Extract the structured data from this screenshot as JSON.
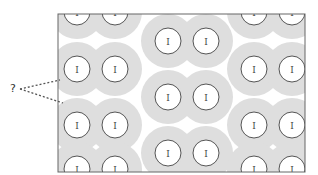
{
  "figure": {
    "question_label": "?",
    "circle_label": "I",
    "circle_label_note": "glyph may be '1' or 'I'; not legible at this resolution",
    "colors": {
      "background": "#ffffff",
      "halo": "#dedede",
      "circle_fill": "#ffffff",
      "circle_stroke": "#555555",
      "frame_stroke": "#666666",
      "pointer_stroke": "#555555"
    },
    "frame": {
      "x": 58,
      "y": 14,
      "width": 247,
      "height": 158
    },
    "halo_radius": 27,
    "circle_radius": 13,
    "columns_left": [
      77,
      115
    ],
    "columns_mid": [
      168,
      206
    ],
    "columns_right": [
      254,
      292
    ],
    "rows_left": [
      12,
      69,
      125,
      169
    ],
    "rows_mid": [
      41,
      97,
      153
    ],
    "rows_right": [
      12,
      69,
      125,
      169
    ]
  }
}
